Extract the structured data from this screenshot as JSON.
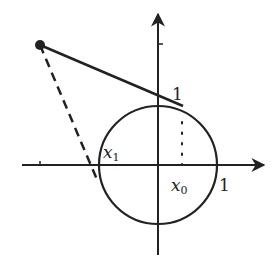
{
  "diagram": {
    "colors": {
      "stroke": "#222222",
      "background": "#ffffff"
    },
    "axes": {
      "origin": [
        158,
        165
      ],
      "x_axis": {
        "from": [
          22,
          165
        ],
        "to": [
          264,
          165
        ],
        "tick_x": 40
      },
      "y_axis": {
        "from": [
          158,
          255
        ],
        "to": [
          158,
          14
        ],
        "tick_y": 44
      }
    },
    "circle": {
      "center": [
        158,
        165
      ],
      "radius": 59
    },
    "external_point": [
      40,
      45
    ],
    "solid_line": {
      "from": [
        40,
        45
      ],
      "to": [
        183,
        106
      ]
    },
    "dashed_line": {
      "from": [
        40,
        45
      ],
      "to": [
        98,
        182
      ]
    },
    "dotted_line": {
      "from": [
        182,
        122
      ],
      "to": [
        182,
        165
      ]
    },
    "labels": {
      "y_one": "1",
      "x_one": "1",
      "x1_base": "x",
      "x1_sub": "1",
      "x0_base": "x",
      "x0_sub": "0"
    }
  }
}
